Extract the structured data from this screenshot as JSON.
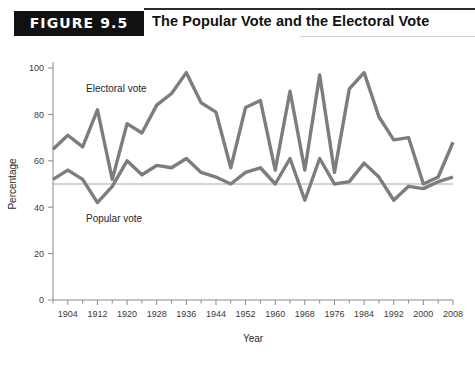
{
  "figure": {
    "banner_label": "FIGURE 9.5",
    "title": "The Popular Vote and the Electoral Vote"
  },
  "colors": {
    "series": "#7d7d7d",
    "axis": "#8b8b8b",
    "reference_line": "#a8a8a8",
    "banner_bg": "#111111",
    "banner_text": "#ffffff",
    "title_text": "#111111"
  },
  "chart_data": {
    "type": "line",
    "title": "The Popular Vote and the Electoral Vote",
    "xlabel": "Year",
    "ylabel": "Percentage",
    "xlim": [
      1900,
      2008
    ],
    "ylim": [
      0,
      100
    ],
    "yticks": [
      0,
      20,
      40,
      60,
      80,
      100
    ],
    "xticks": [
      1904,
      1912,
      1920,
      1928,
      1936,
      1944,
      1952,
      1960,
      1968,
      1976,
      1984,
      1992,
      2000,
      2008
    ],
    "minor_tick_interval": 4,
    "grid": false,
    "legend": "inline-labels",
    "reference_line": {
      "value": 50,
      "label": ""
    },
    "x": [
      1900,
      1904,
      1908,
      1912,
      1916,
      1920,
      1924,
      1928,
      1932,
      1936,
      1940,
      1944,
      1948,
      1952,
      1956,
      1960,
      1964,
      1968,
      1972,
      1976,
      1980,
      1984,
      1988,
      1992,
      1996,
      2000,
      2004,
      2008
    ],
    "series": [
      {
        "name": "Electoral vote",
        "label": "Electoral vote",
        "color": "#7d7d7d",
        "values": [
          65,
          71,
          66,
          82,
          52,
          76,
          72,
          84,
          89,
          98,
          85,
          81,
          57,
          83,
          86,
          56,
          90,
          56,
          97,
          55,
          91,
          98,
          79,
          69,
          70,
          50,
          53,
          68
        ]
      },
      {
        "name": "Popular vote",
        "label": "Popular vote",
        "color": "#7d7d7d",
        "values": [
          52,
          56,
          52,
          42,
          49,
          60,
          54,
          58,
          57,
          61,
          55,
          53,
          50,
          55,
          57,
          50,
          61,
          43,
          61,
          50,
          51,
          59,
          53,
          43,
          49,
          48,
          51,
          53
        ]
      }
    ]
  }
}
